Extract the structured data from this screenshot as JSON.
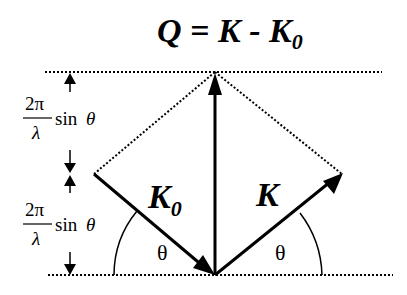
{
  "title": {
    "lhs": "Q",
    "eq": " = ",
    "k": "K",
    "minus": " - ",
    "k0": "K",
    "k0_sub": "0"
  },
  "labels": {
    "k0_vector": "K",
    "k0_vector_sub": "0",
    "k_vector": "K",
    "theta_left": "θ",
    "theta_right": "θ"
  },
  "spacing_upper": {
    "numerator": "2π",
    "denominator": "λ",
    "func": "sin",
    "var": "θ"
  },
  "spacing_lower": {
    "numerator": "2π",
    "denominator": "λ",
    "func": "sin",
    "var": "θ"
  },
  "colors": {
    "ink": "#000000",
    "background": "#ffffff"
  }
}
